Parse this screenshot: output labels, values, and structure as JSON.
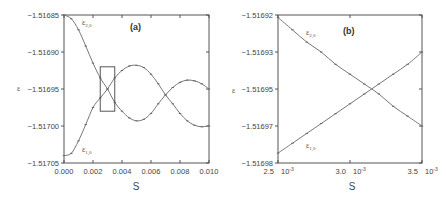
{
  "chart_data": [
    {
      "type": "line",
      "panel": "(a)",
      "xlabel": "S",
      "ylabel": "ε",
      "xlim": [
        0.0,
        0.01
      ],
      "ylim": [
        -1.51705,
        -1.51685
      ],
      "xticks": [
        "0.000",
        "0.002",
        "0.004",
        "0.006",
        "0.008",
        "0.010"
      ],
      "yticks": [
        "-1.51685",
        "-1.51690",
        "-1.51695",
        "-1.51700",
        "-1.51705"
      ],
      "grid": false,
      "inset_box": {
        "x": [
          0.0025,
          0.0035
        ],
        "y": [
          -1.51698,
          -1.51692
        ]
      },
      "x": [
        0.0,
        0.0005,
        0.001,
        0.0015,
        0.002,
        0.0025,
        0.003,
        0.0035,
        0.004,
        0.0045,
        0.005,
        0.0055,
        0.006,
        0.0065,
        0.007,
        0.0075,
        0.008,
        0.0085,
        0.009,
        0.0095,
        0.01
      ],
      "series": [
        {
          "name": "ε2,0",
          "label_main": "ε",
          "label_sub": "2,0",
          "values": [
            -1.51685,
            -1.516855,
            -1.51687,
            -1.516892,
            -1.516915,
            -1.516935,
            -1.51695,
            -1.516968,
            -1.51698,
            -1.516989,
            -1.516993,
            -1.516991,
            -1.516983,
            -1.51697,
            -1.516958,
            -1.516948,
            -1.516941,
            -1.516938,
            -1.516939,
            -1.516943,
            -1.51695
          ]
        },
        {
          "name": "ε1,0",
          "label_main": "ε",
          "label_sub": "1,0",
          "values": [
            -1.51704,
            -1.517037,
            -1.51702,
            -1.516998,
            -1.516975,
            -1.516962,
            -1.51695,
            -1.516935,
            -1.516925,
            -1.516919,
            -1.516918,
            -1.516921,
            -1.51693,
            -1.516943,
            -1.516958,
            -1.51697,
            -1.516983,
            -1.516993,
            -1.516999,
            -1.517001,
            -1.517
          ]
        }
      ]
    },
    {
      "type": "line",
      "panel": "(b)",
      "xlabel": "S",
      "ylabel": "ε",
      "xlim": [
        0.0025,
        0.0035
      ],
      "ylim": [
        -1.51698,
        -1.51692
      ],
      "xticks": [
        "2.5 10⁻³",
        "3.0 10⁻³",
        "3.5 10⁻³"
      ],
      "xtick_values": [
        0.0025,
        0.003,
        0.0035
      ],
      "yticks": [
        "-1.51692",
        "-1.51693",
        "-1.51695",
        "-1.51697",
        "-1.51698"
      ],
      "ytick_values": [
        -1.51692,
        -1.516935,
        -1.51695,
        -1.516965,
        -1.51698
      ],
      "grid": false,
      "x": [
        0.0025,
        0.0026,
        0.0027,
        0.0028,
        0.0029,
        0.003,
        0.0031,
        0.0032,
        0.0033,
        0.0034,
        0.0035
      ],
      "series": [
        {
          "name": "ε2,0",
          "label_main": "ε",
          "label_sub": "2,0",
          "values": [
            -1.516921,
            -1.516926,
            -1.516931,
            -1.516935,
            -1.51694,
            -1.516944,
            -1.516948,
            -1.516952,
            -1.516957,
            -1.516961,
            -1.516965
          ]
        },
        {
          "name": "ε1,0",
          "label_main": "ε",
          "label_sub": "1,0",
          "values": [
            -1.516976,
            -1.516972,
            -1.516968,
            -1.516964,
            -1.51696,
            -1.516956,
            -1.516952,
            -1.516948,
            -1.516944,
            -1.51694,
            -1.516935
          ]
        }
      ]
    }
  ],
  "labels": {
    "panel_a": "(a)",
    "panel_b": "(b)",
    "xlabel": "S",
    "ylabel": "ε",
    "eps": "ε",
    "sub20": "2,0",
    "sub10": "1,0",
    "a_x": [
      "0.000",
      "0.002",
      "0.004",
      "0.006",
      "0.008",
      "0.010"
    ],
    "a_y": [
      "-1.51685",
      "-1.51690",
      "-1.51695",
      "-1.51700",
      "-1.51705"
    ],
    "b_x": [
      "2.5",
      "3.0",
      "3.5"
    ],
    "b_x_exp": "10",
    "b_x_pow": "-3",
    "b_y": [
      "-1.51692",
      "-1.51693",
      "-1.51695",
      "-1.51697",
      "-1.51698"
    ]
  },
  "colors": {
    "axis": "#555555",
    "curve": "#777777",
    "text": "#444444"
  }
}
